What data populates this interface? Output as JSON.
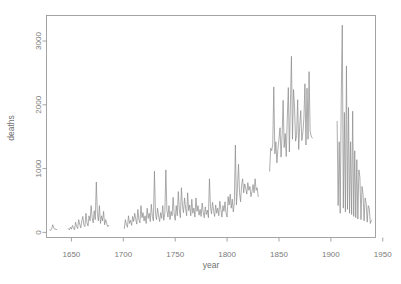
{
  "chart_data": {
    "type": "line",
    "title": "",
    "subtitle": "",
    "xlabel": "year",
    "ylabel": "deaths",
    "xlim": [
      1626,
      1943
    ],
    "ylim": [
      -80,
      3400
    ],
    "xticks": [
      1650,
      1700,
      1750,
      1800,
      1850,
      1900,
      1950
    ],
    "xticklabels": [
      "1650",
      "1700",
      "1750",
      "1800",
      "1850",
      "1900",
      "1950"
    ],
    "yticks": [
      0,
      1000,
      2000,
      3000
    ],
    "yticklabels": [
      "0",
      "1000",
      "2000",
      "3000"
    ],
    "grid": false,
    "legend": null,
    "line_color": "#8a8a8a",
    "axis_color": "#9a9a9a",
    "text_color": "#7b7b7b",
    "background": "#ffffff",
    "segments": [
      {
        "name": "1629-1636",
        "x": [
          1629,
          1630,
          1631,
          1632,
          1633,
          1634,
          1635,
          1636
        ],
        "y": [
          40,
          30,
          60,
          120,
          70,
          45,
          55,
          40
        ]
      },
      {
        "name": "1647-1686",
        "x": [
          1647,
          1648,
          1649,
          1650,
          1651,
          1652,
          1653,
          1654,
          1655,
          1656,
          1657,
          1658,
          1659,
          1660,
          1661,
          1662,
          1663,
          1664,
          1665,
          1666,
          1667,
          1668,
          1669,
          1670,
          1671,
          1672,
          1673,
          1674,
          1675,
          1676,
          1677,
          1678,
          1679,
          1680,
          1681,
          1682,
          1683,
          1684,
          1685,
          1686
        ],
        "y": [
          60,
          40,
          80,
          50,
          110,
          70,
          40,
          160,
          90,
          60,
          200,
          130,
          70,
          180,
          250,
          120,
          90,
          300,
          150,
          100,
          260,
          180,
          420,
          230,
          150,
          340,
          200,
          790,
          300,
          180,
          420,
          140,
          260,
          180,
          330,
          120,
          200,
          140,
          90,
          110
        ]
      },
      {
        "name": "1701-1830",
        "x": [
          1701,
          1702,
          1703,
          1704,
          1705,
          1706,
          1707,
          1708,
          1709,
          1710,
          1711,
          1712,
          1713,
          1714,
          1715,
          1716,
          1717,
          1718,
          1719,
          1720,
          1721,
          1722,
          1723,
          1724,
          1725,
          1726,
          1727,
          1728,
          1729,
          1730,
          1731,
          1732,
          1733,
          1734,
          1735,
          1736,
          1737,
          1738,
          1739,
          1740,
          1741,
          1742,
          1743,
          1744,
          1745,
          1746,
          1747,
          1748,
          1749,
          1750,
          1751,
          1752,
          1753,
          1754,
          1755,
          1756,
          1757,
          1758,
          1759,
          1760,
          1761,
          1762,
          1763,
          1764,
          1765,
          1766,
          1767,
          1768,
          1769,
          1770,
          1771,
          1772,
          1773,
          1774,
          1775,
          1776,
          1777,
          1778,
          1779,
          1780,
          1781,
          1782,
          1783,
          1784,
          1785,
          1786,
          1787,
          1788,
          1789,
          1790,
          1791,
          1792,
          1793,
          1794,
          1795,
          1796,
          1797,
          1798,
          1799,
          1800,
          1801,
          1802,
          1803,
          1804,
          1805,
          1806,
          1807,
          1808,
          1809,
          1810,
          1811,
          1812,
          1813,
          1814,
          1815,
          1816,
          1817,
          1818,
          1819,
          1820,
          1821,
          1822,
          1823,
          1824,
          1825,
          1826,
          1827,
          1828,
          1829,
          1830
        ],
        "y": [
          60,
          200,
          120,
          80,
          260,
          140,
          190,
          110,
          250,
          170,
          300,
          210,
          130,
          360,
          200,
          150,
          420,
          230,
          310,
          180,
          260,
          140,
          380,
          220,
          300,
          170,
          440,
          250,
          180,
          960,
          300,
          200,
          380,
          260,
          170,
          310,
          220,
          420,
          190,
          300,
          980,
          350,
          240,
          420,
          200,
          330,
          260,
          550,
          300,
          190,
          420,
          260,
          640,
          350,
          230,
          700,
          420,
          310,
          540,
          380,
          260,
          620,
          340,
          430,
          260,
          520,
          300,
          380,
          240,
          540,
          330,
          420,
          270,
          360,
          250,
          460,
          320,
          230,
          400,
          280,
          350,
          230,
          840,
          400,
          290,
          470,
          340,
          250,
          430,
          300,
          380,
          260,
          490,
          360,
          240,
          420,
          330,
          480,
          300,
          240,
          560,
          430,
          600,
          380,
          520,
          320,
          480,
          1370,
          430,
          700,
          1070,
          620,
          480,
          740,
          840,
          620,
          760,
          690,
          600,
          780,
          660,
          720,
          560,
          640,
          750,
          620,
          840,
          660,
          700,
          560,
          780,
          620,
          530
        ]
      },
      {
        "name": "1841-1882",
        "x": [
          1841,
          1842,
          1843,
          1844,
          1845,
          1846,
          1847,
          1848,
          1849,
          1850,
          1851,
          1852,
          1853,
          1854,
          1855,
          1856,
          1857,
          1858,
          1859,
          1860,
          1861,
          1862,
          1863,
          1864,
          1865,
          1866,
          1867,
          1868,
          1869,
          1870,
          1871,
          1872,
          1873,
          1874,
          1875,
          1876,
          1877,
          1878,
          1879,
          1880,
          1881,
          1882
        ],
        "y": [
          960,
          1320,
          1280,
          1380,
          2280,
          1230,
          1420,
          1090,
          1310,
          1460,
          1640,
          1180,
          1520,
          2070,
          1330,
          1550,
          1190,
          1780,
          2270,
          1260,
          2000,
          2760,
          1460,
          2240,
          1970,
          1430,
          1520,
          2080,
          1300,
          1680,
          1910,
          1440,
          1560,
          1790,
          2330,
          1370,
          2260,
          1460,
          2520,
          1590,
          1510,
          1480
        ]
      },
      {
        "name": "1906-1939",
        "x": [
          1906,
          1907,
          1908,
          1909,
          1910,
          1911,
          1912,
          1913,
          1914,
          1915,
          1916,
          1917,
          1918,
          1919,
          1920,
          1921,
          1922,
          1923,
          1924,
          1925,
          1926,
          1927,
          1928,
          1929,
          1930,
          1931,
          1932,
          1933,
          1934,
          1935,
          1936,
          1937,
          1938,
          1939
        ],
        "y": [
          1740,
          420,
          1420,
          300,
          2120,
          3250,
          380,
          1880,
          320,
          2610,
          360,
          1960,
          300,
          1420,
          280,
          1900,
          250,
          1280,
          230,
          1140,
          210,
          980,
          860,
          200,
          720,
          600,
          180,
          540,
          460,
          160,
          420,
          380,
          140,
          190
        ]
      }
    ]
  },
  "axes": {
    "ylabel": "deaths",
    "xlabel": "year"
  }
}
